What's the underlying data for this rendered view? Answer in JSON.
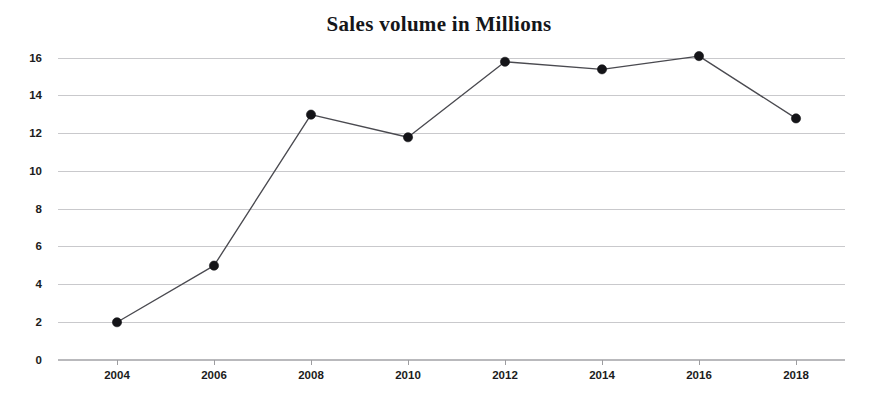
{
  "chart_data": {
    "type": "line",
    "title": "Sales volume in Millions",
    "xlabel": "",
    "ylabel": "",
    "categories": [
      "2004",
      "2006",
      "2008",
      "2010",
      "2012",
      "2014",
      "2016",
      "2018"
    ],
    "x": [
      2004,
      2006,
      2008,
      2010,
      2012,
      2014,
      2016,
      2018
    ],
    "values": [
      2.0,
      5.0,
      13.0,
      11.8,
      15.8,
      15.4,
      16.1,
      12.8
    ],
    "series": [
      {
        "name": "Sales volume",
        "values": [
          2.0,
          5.0,
          13.0,
          11.8,
          15.8,
          15.4,
          16.1,
          12.8
        ]
      }
    ],
    "ylim": [
      0,
      16
    ],
    "xlim": [
      2004,
      2018
    ],
    "yticks": [
      0,
      2,
      4,
      6,
      8,
      10,
      12,
      14,
      16
    ],
    "ytick_labels": [
      "0",
      "2",
      "4",
      "6",
      "8",
      "10",
      "12",
      "14",
      "16"
    ],
    "xticks": [
      2004,
      2006,
      2008,
      2010,
      2012,
      2014,
      2016,
      2018
    ],
    "xtick_labels": [
      "2004",
      "2006",
      "2008",
      "2010",
      "2012",
      "2014",
      "2016",
      "2018"
    ],
    "grid": true,
    "grid_axis": "y",
    "legend": false,
    "legend_position": "none",
    "marker": "circle",
    "colors": {
      "line": "#4a4a50",
      "marker": "#141418",
      "grid": "#c9c9cc",
      "text": "#1b1c20",
      "background": "#ffffff"
    }
  }
}
